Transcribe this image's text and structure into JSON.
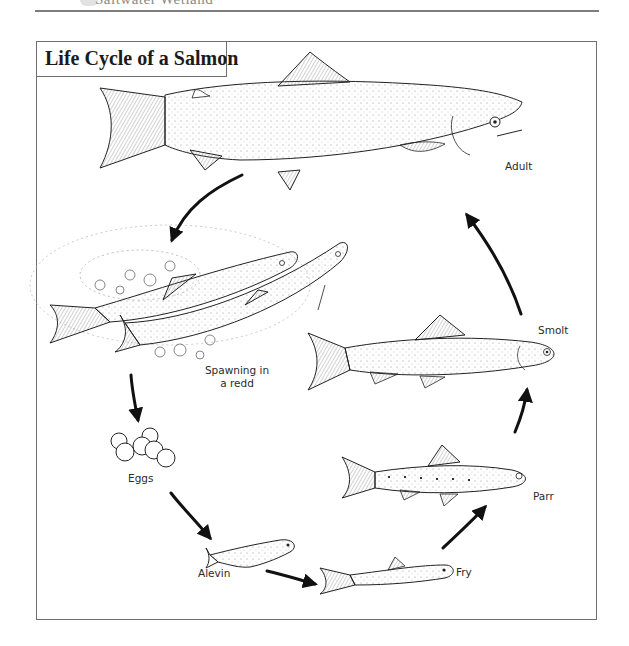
{
  "page": {
    "running_header": "Saltwater Wetland"
  },
  "figure": {
    "title": "Life Cycle of a Salmon",
    "stages": [
      {
        "id": "adult",
        "label": "Adult"
      },
      {
        "id": "spawning",
        "label": "Spawning in a redd",
        "label_lines": [
          "Spawning in",
          "a redd"
        ]
      },
      {
        "id": "eggs",
        "label": "Eggs"
      },
      {
        "id": "alevin",
        "label": "Alevin"
      },
      {
        "id": "fry",
        "label": "Fry"
      },
      {
        "id": "parr",
        "label": "Parr"
      },
      {
        "id": "smolt",
        "label": "Smolt"
      }
    ],
    "cycle_order": [
      "Adult",
      "Spawning in a redd",
      "Eggs",
      "Alevin",
      "Fry",
      "Parr",
      "Smolt",
      "Adult"
    ],
    "colors": {
      "ink": "#1b1b1b",
      "border": "#6f6f6f",
      "background": "#ffffff"
    }
  }
}
